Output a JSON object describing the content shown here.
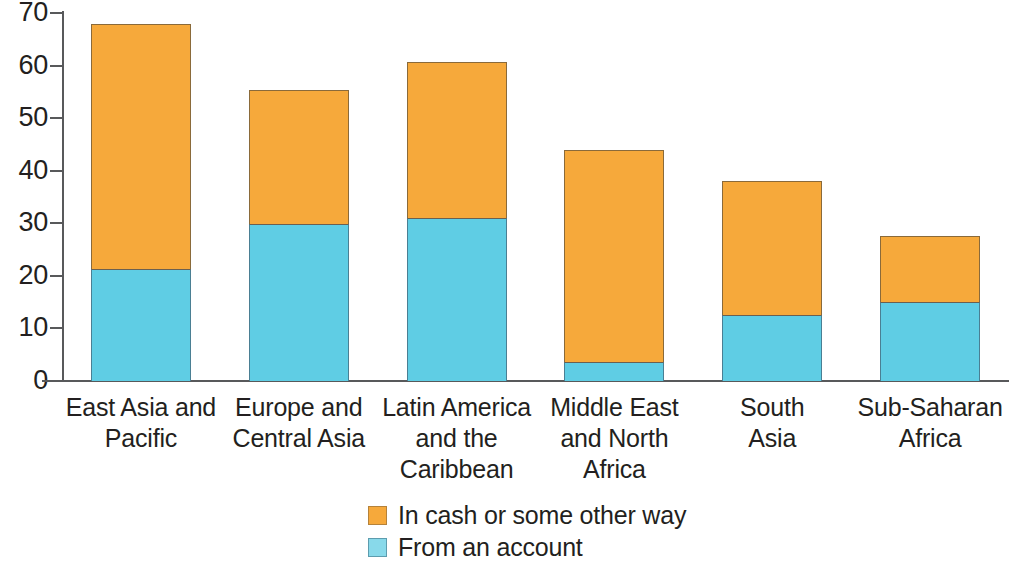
{
  "chart_data": {
    "type": "bar",
    "subtype": "stacked-bar",
    "title": "",
    "subtitle": "",
    "xlabel": "",
    "ylabel": "",
    "ylim": [
      0,
      70
    ],
    "ytick_values": [
      0,
      10,
      20,
      30,
      40,
      50,
      60,
      70
    ],
    "ytick_labels": [
      "0",
      "10",
      "20",
      "30",
      "40",
      "50",
      "60",
      "70"
    ],
    "grid": false,
    "legend_position": "bottom-center",
    "stack_order_bottom_to_top": [
      "From an account",
      "In cash or some other way"
    ],
    "categories": [
      "East Asia and Pacific",
      "Europe and Central Asia",
      "Latin America and the Caribbean",
      "Middle East and North Africa",
      "South Asia",
      "Sub-Saharan Africa"
    ],
    "category_label_lines": [
      [
        "East Asia and",
        "Pacific"
      ],
      [
        "Europe and",
        "Central Asia"
      ],
      [
        "Latin America",
        "and the",
        "Caribbean"
      ],
      [
        "Middle East",
        "and North",
        "Africa"
      ],
      [
        "South",
        "Asia"
      ],
      [
        "Sub-Saharan",
        "Africa"
      ]
    ],
    "series": [
      {
        "name": "From an account",
        "color": "#5fcde4",
        "values": [
          21.3,
          29.8,
          31.0,
          3.6,
          12.6,
          15.0
        ]
      },
      {
        "name": "In cash or some other way",
        "color": "#f6a93b",
        "values": [
          46.7,
          25.6,
          29.7,
          40.3,
          25.4,
          12.6
        ]
      }
    ],
    "totals": [
      68.0,
      55.4,
      60.7,
      43.9,
      38.0,
      27.6
    ]
  },
  "legend": {
    "items": [
      {
        "label": "In cash or some other way",
        "color": "#f6a93b",
        "swatch": "orange-swatch"
      },
      {
        "label": "From an account",
        "color": "#5fcde4",
        "swatch": "blue-swatch"
      }
    ]
  },
  "axis": {
    "y_labels": [
      "70",
      "60",
      "50",
      "40",
      "30",
      "20",
      "10",
      "0"
    ]
  }
}
